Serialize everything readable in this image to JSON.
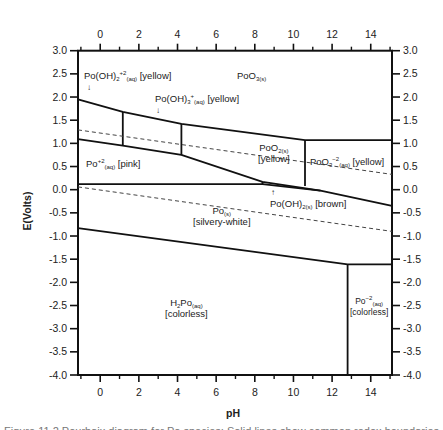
{
  "chart_data": {
    "type": "pourbaix",
    "title": "",
    "xlabel": "pH",
    "ylabel": "E(Volts)",
    "xlim": [
      -1.15,
      15.1
    ],
    "ylim": [
      -4.0,
      3.0
    ],
    "x_ticks": [
      0,
      2,
      4,
      6,
      8,
      10,
      12,
      14
    ],
    "x_minor_ticks": [
      -1,
      1,
      3,
      5,
      7,
      9,
      11,
      13,
      15
    ],
    "y_ticks": [
      3.0,
      2.5,
      2.0,
      1.5,
      1.0,
      0.5,
      0.0,
      -0.5,
      -1.0,
      -1.5,
      -2.0,
      -2.5,
      -3.0,
      -3.5,
      -4.0
    ],
    "y_tick_labels": [
      "3.0",
      "2.5",
      "2.0",
      "1.5",
      "1.0",
      "0.5",
      "0.0",
      "-0.5",
      "-1.0",
      "-1.5",
      "-2.0",
      "-2.5",
      "-3.0",
      "-3.5",
      "-4.0"
    ],
    "top_axis_mirrors_bottom": true,
    "right_axis_mirrors_left": true,
    "boundaries": [
      {
        "name": "upper-oxidation-line",
        "style": "solid",
        "points": [
          [
            -1.15,
            1.95
          ],
          [
            1.17,
            1.68
          ],
          [
            4.2,
            1.42
          ],
          [
            10.6,
            1.07
          ],
          [
            15.1,
            1.07
          ]
        ]
      },
      {
        "name": "po2plus-poo2-line",
        "style": "solid",
        "points": [
          [
            -1.15,
            1.09
          ],
          [
            1.17,
            0.95
          ],
          [
            4.2,
            0.75
          ],
          [
            8.4,
            0.17
          ],
          [
            11.4,
            -0.02
          ],
          [
            15.1,
            -0.35
          ]
        ]
      },
      {
        "name": "vertical-ph-1.2",
        "style": "solid",
        "points": [
          [
            1.17,
            1.68
          ],
          [
            1.17,
            0.95
          ]
        ]
      },
      {
        "name": "vertical-ph-4.2",
        "style": "solid",
        "points": [
          [
            4.2,
            1.42
          ],
          [
            4.2,
            0.75
          ]
        ]
      },
      {
        "name": "vertical-ph-10.6",
        "style": "solid",
        "points": [
          [
            10.6,
            1.07
          ],
          [
            10.6,
            0.08
          ]
        ]
      },
      {
        "name": "po-solid-upper-line",
        "style": "solid",
        "points": [
          [
            -1.15,
            0.12
          ],
          [
            8.4,
            0.12
          ],
          [
            11.4,
            -0.02
          ]
        ]
      },
      {
        "name": "po-oh2-sliver-top",
        "style": "solid",
        "points": [
          [
            8.4,
            0.17
          ],
          [
            8.4,
            0.12
          ]
        ]
      },
      {
        "name": "lower-reduction-line",
        "style": "solid",
        "points": [
          [
            -1.15,
            -0.83
          ],
          [
            12.8,
            -1.61
          ],
          [
            15.1,
            -1.61
          ]
        ]
      },
      {
        "name": "vertical-ph-12.8",
        "style": "solid",
        "points": [
          [
            12.8,
            -1.61
          ],
          [
            12.8,
            -4.0
          ]
        ]
      },
      {
        "name": "water-oxidation-dashed",
        "style": "dashed",
        "points": [
          [
            -1.15,
            1.29
          ],
          [
            15.1,
            0.33
          ]
        ]
      },
      {
        "name": "water-reduction-dashed",
        "style": "dashed",
        "points": [
          [
            -1.15,
            0.06
          ],
          [
            15.1,
            -0.9
          ]
        ]
      }
    ],
    "regions": [
      {
        "species": "Po(OH)2^+2 (aq)",
        "color_note": "[yellow]",
        "label_at": [
          -0.9,
          2.4
        ]
      },
      {
        "species": "Po(OH)3^+ (aq)",
        "color_note": "[yellow]",
        "label_at": [
          3.0,
          1.9
        ]
      },
      {
        "species": "PoO3 (s)",
        "color_note": "",
        "label_at": [
          8.2,
          2.45
        ]
      },
      {
        "species": "PoO2 (s)",
        "color_note": "[yellow]",
        "label_at": [
          8.0,
          0.8
        ]
      },
      {
        "species": "PoO3^-2 (aq)",
        "color_note": "[yellow]",
        "label_at": [
          12.5,
          0.5
        ]
      },
      {
        "species": "Po^+2 (aq)",
        "color_note": "[pink]",
        "label_at": [
          0.6,
          0.55
        ]
      },
      {
        "species": "Po(OH)2 (s)",
        "color_note": "[brown]",
        "label_at": [
          10.3,
          -0.4
        ]
      },
      {
        "species": "Po (s)",
        "color_note": "[silvery-white]",
        "label_at": [
          6.7,
          -0.65
        ]
      },
      {
        "species": "H2Po (aq)",
        "color_note": "[colorless]",
        "label_at": [
          5.0,
          -2.65
        ]
      },
      {
        "species": "Po^-2 (aq)",
        "color_note": "[colorless]",
        "label_at": [
          14.0,
          -2.6
        ]
      }
    ]
  },
  "axes": {
    "xlabel": "pH",
    "ylabel": "E(Volts)"
  },
  "labels": {
    "po_oh2_2plus": {
      "base": "Po(OH)",
      "sub1": "2",
      "sup": "+2",
      "sub2": "(aq)",
      "note": "[yellow]"
    },
    "po_oh3_plus": {
      "base": "Po(OH)",
      "sub1": "3",
      "sup": "+",
      "sub2": "(aq)",
      "note": "[yellow]"
    },
    "poo3_s": {
      "base": "PoO",
      "sub": "3(s)"
    },
    "poo2_s": {
      "base": "PoO",
      "sub": "2(s)",
      "note": "[yellow]"
    },
    "poo3_2minus": {
      "base": "PoO",
      "sub1": "3",
      "sup": "−2",
      "sub2": "(aq)",
      "note": "[yellow]"
    },
    "po_2plus": {
      "base": "Po",
      "sup": "+2",
      "sub": "(aq)",
      "note": "[pink]"
    },
    "po_oh2_s": {
      "base": "Po(OH)",
      "sub": "2(s)",
      "note": "[brown]"
    },
    "po_s": {
      "base": "Po",
      "sub": "(s)",
      "note": "[silvery-white]"
    },
    "h2po": {
      "pre": "H",
      "sub1": "2",
      "base": "Po",
      "sub2": "(aq)",
      "note": "[colorless]"
    },
    "po_2minus": {
      "base": "Po",
      "sup": "−2",
      "sub": "(aq)",
      "note": "[colorless]"
    },
    "arrow_down": "↓",
    "arrow_up": "↑"
  },
  "caption": "Figure 11.2 Pourbaix diagram for Po species; Solid lines show common redox boundaries"
}
